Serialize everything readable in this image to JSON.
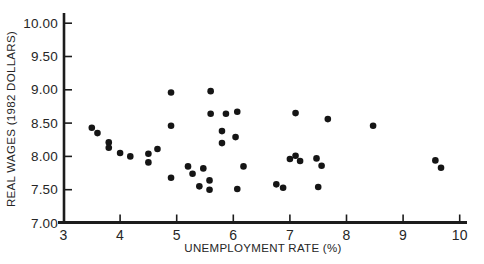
{
  "style": {
    "background": "#ffffff",
    "axis_color": "#1c1c1c",
    "text_color": "#262626",
    "marker_color": "#151515"
  },
  "chart_data": {
    "type": "scatter",
    "title": "",
    "xlabel": "UNEMPLOYMENT RATE (%)",
    "ylabel": "REAL WAGES (1982 DOLLARS)",
    "xlim": [
      3,
      10
    ],
    "ylim": [
      7,
      10
    ],
    "grid": false,
    "legend": null,
    "x_ticks": [
      3,
      4,
      5,
      6,
      7,
      8,
      9,
      10
    ],
    "x_tick_labels": [
      "3",
      "4",
      "5",
      "6",
      "7",
      "8",
      "9",
      "10"
    ],
    "y_ticks": [
      7.0,
      7.5,
      8.0,
      8.5,
      9.0,
      9.5,
      10.0
    ],
    "y_tick_labels": [
      "7.00",
      "7.50",
      "8.00",
      "8.50",
      "9.00",
      "9.50",
      "10.00"
    ],
    "marker": {
      "shape": "circle",
      "color": "#151515",
      "radius": 3.3
    },
    "points": [
      [
        3.5,
        8.43
      ],
      [
        3.6,
        8.35
      ],
      [
        3.8,
        8.21
      ],
      [
        3.8,
        8.13
      ],
      [
        4.0,
        8.05
      ],
      [
        4.18,
        8.0
      ],
      [
        4.5,
        8.04
      ],
      [
        4.5,
        7.91
      ],
      [
        4.66,
        8.11
      ],
      [
        4.9,
        8.96
      ],
      [
        4.9,
        8.46
      ],
      [
        4.9,
        7.68
      ],
      [
        5.2,
        7.85
      ],
      [
        5.28,
        7.74
      ],
      [
        5.47,
        7.82
      ],
      [
        5.4,
        7.55
      ],
      [
        5.58,
        7.64
      ],
      [
        5.58,
        7.5
      ],
      [
        5.6,
        8.98
      ],
      [
        5.6,
        8.64
      ],
      [
        5.87,
        8.64
      ],
      [
        5.8,
        8.38
      ],
      [
        5.8,
        8.2
      ],
      [
        6.04,
        8.29
      ],
      [
        6.07,
        8.67
      ],
      [
        6.18,
        7.85
      ],
      [
        6.07,
        7.51
      ],
      [
        6.76,
        7.58
      ],
      [
        6.88,
        7.53
      ],
      [
        7.0,
        7.96
      ],
      [
        7.1,
        8.01
      ],
      [
        7.18,
        7.93
      ],
      [
        7.47,
        7.97
      ],
      [
        7.56,
        7.86
      ],
      [
        7.5,
        7.54
      ],
      [
        7.1,
        8.65
      ],
      [
        7.67,
        8.56
      ],
      [
        8.47,
        8.46
      ],
      [
        9.57,
        7.94
      ],
      [
        9.67,
        7.83
      ]
    ]
  }
}
